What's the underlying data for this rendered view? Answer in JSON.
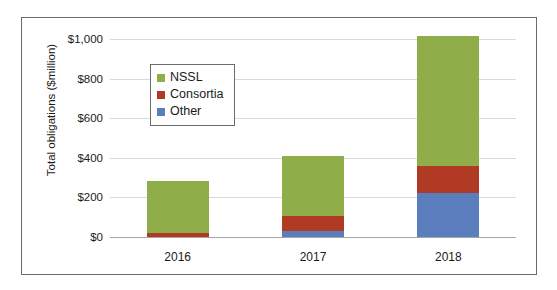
{
  "chart_data": {
    "type": "bar",
    "subtype": "stacked-vertical",
    "title": "",
    "xlabel": "",
    "ylabel": "Total obligations ($million)",
    "categories": [
      "2016",
      "2017",
      "2018"
    ],
    "ylim": [
      0,
      1000
    ],
    "yticks": [
      0,
      200,
      400,
      600,
      800,
      1000
    ],
    "ytick_labels": [
      "$0",
      "$200",
      "$400",
      "$600",
      "$800",
      "$1,000"
    ],
    "grid": "horizontal",
    "legend_position": "inside-upper-left",
    "series": [
      {
        "name": "Other",
        "color": "#5B7EBF",
        "values": [
          0,
          30,
          220
        ]
      },
      {
        "name": "Consortia",
        "color": "#B03A24",
        "values": [
          20,
          75,
          140
        ]
      },
      {
        "name": "NSSL",
        "color": "#8FAE4A",
        "values": [
          262,
          305,
          655
        ]
      }
    ],
    "stack_order_bottom_to_top": [
      "Other",
      "Consortia",
      "NSSL"
    ],
    "legend_order_top_to_bottom": [
      "NSSL",
      "Consortia",
      "Other"
    ],
    "totals": [
      282,
      410,
      1010
    ]
  },
  "axis": {
    "y_title": "Total obligations ($million)",
    "ticks": [
      {
        "label": "$1,000",
        "value": 1000
      },
      {
        "label": "$800",
        "value": 800
      },
      {
        "label": "$600",
        "value": 600
      },
      {
        "label": "$400",
        "value": 400
      },
      {
        "label": "$200",
        "value": 200
      },
      {
        "label": "$0",
        "value": 0
      }
    ]
  },
  "legend": {
    "entries": [
      {
        "label": "NSSL",
        "color": "#8FAE4A"
      },
      {
        "label": "Consortia",
        "color": "#B03A24"
      },
      {
        "label": "Other",
        "color": "#5B7EBF"
      }
    ]
  },
  "colors": {
    "nssl": "#8FAE4A",
    "consortia": "#B03A24",
    "other": "#5B7EBF",
    "frame": "#6b6b6b",
    "gridline": "#d9d9d9",
    "text": "#1a1a1a"
  }
}
